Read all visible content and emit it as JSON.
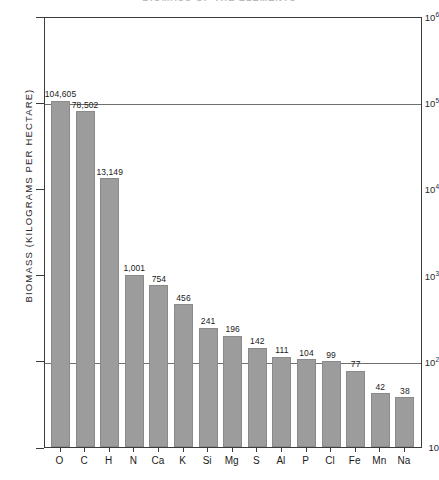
{
  "chart_data": {
    "type": "bar",
    "title": "",
    "xlabel": "",
    "ylabel": "BIOMASS  (KILOGRAMS PER HECTARE)",
    "yscale": "log",
    "ylim": [
      10,
      1000000
    ],
    "grid": true,
    "legend": "none",
    "categories": [
      "O",
      "C",
      "H",
      "N",
      "Ca",
      "K",
      "Si",
      "Mg",
      "S",
      "Al",
      "P",
      "Cl",
      "Fe",
      "Mn",
      "Na"
    ],
    "values": [
      104605,
      78502,
      13149,
      1001,
      754,
      456,
      241,
      196,
      142,
      111,
      104,
      99,
      77,
      42,
      38
    ],
    "value_labels": [
      "104,605",
      "78,502",
      "13,149",
      "1,001",
      "754",
      "456",
      "241",
      "196",
      "142",
      "111",
      "104",
      "99",
      "77",
      "42",
      "38"
    ],
    "ytick_values": [
      1000000,
      100000,
      10000,
      1000,
      100,
      10
    ],
    "ytick_labels": [
      "10⁶",
      "10⁵",
      "10⁴",
      "10³",
      "10²",
      "10"
    ],
    "ytick_mantissas": [
      "10",
      "10",
      "10",
      "10",
      "10",
      "10"
    ],
    "ytick_exponents": [
      "6",
      "5",
      "4",
      "3",
      "2",
      ""
    ],
    "gridline_values": [
      100000,
      100
    ],
    "bar_color": "#9c9c9c",
    "axis_color": "#3b3b3b",
    "grid_color": "#6f6f6f"
  },
  "figure": {
    "title_clipped": "BIOMASS OF THE ELEMENTS"
  }
}
